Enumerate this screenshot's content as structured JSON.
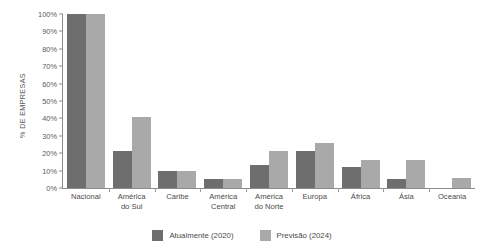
{
  "chart_data": {
    "type": "bar",
    "title": "",
    "xlabel": "",
    "ylabel": "% DE EMPRESAS",
    "ylim": [
      0,
      100
    ],
    "grid": false,
    "legend_position": "bottom-center",
    "ytick_labels": [
      "100%",
      "90%",
      "80%",
      "70%",
      "60%",
      "50%",
      "40%",
      "30%",
      "20%",
      "10%",
      "0%"
    ],
    "ytick_values": [
      100,
      90,
      80,
      70,
      60,
      50,
      40,
      30,
      20,
      10,
      0
    ],
    "categories": [
      "Nacional",
      "América do Sul",
      "Caribe",
      "América Central",
      "América do Norte",
      "Europa",
      "África",
      "Ásia",
      "Oceania"
    ],
    "category_lines": [
      [
        "Nacional",
        ""
      ],
      [
        "América",
        "do Sul"
      ],
      [
        "Caribe",
        ""
      ],
      [
        "América",
        "Central"
      ],
      [
        "América",
        "do Norte"
      ],
      [
        "Europa",
        ""
      ],
      [
        "África",
        ""
      ],
      [
        "Ásia",
        ""
      ],
      [
        "Oceania",
        ""
      ]
    ],
    "series": [
      {
        "name": "Atualmente (2020)",
        "color": "#6e6e6e",
        "values": [
          100,
          21,
          10,
          5,
          13,
          21,
          12,
          5,
          0
        ]
      },
      {
        "name": "Previsão (2024)",
        "color": "#a9a9a9",
        "values": [
          100,
          41,
          10,
          5,
          21,
          26,
          16,
          16,
          6
        ]
      }
    ]
  },
  "legend": {
    "items": [
      {
        "label": "Atualmente (2020)",
        "color": "#6e6e6e"
      },
      {
        "label": "Previsão (2024)",
        "color": "#a9a9a9"
      }
    ]
  },
  "colors": {
    "current": "#6e6e6e",
    "forecast": "#a9a9a9",
    "axis": "#8c8c8c",
    "text": "#4a4a4a",
    "background": "#ffffff"
  }
}
